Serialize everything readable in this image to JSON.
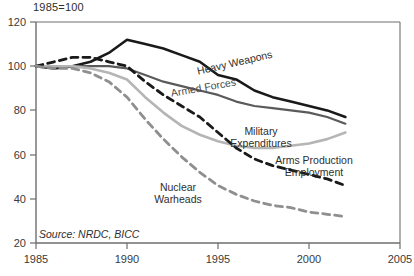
{
  "chart_data": {
    "type": "line",
    "title": "1985=100",
    "xlabel": "",
    "ylabel": "",
    "xlim": [
      1985,
      2005
    ],
    "ylim": [
      20,
      120
    ],
    "grid": false,
    "legend_position": "inline-annotations",
    "xticks": [
      "1985",
      "1990",
      "1995",
      "2000",
      "2005"
    ],
    "yticks": [
      "120",
      "100",
      "80",
      "60",
      "40",
      "20"
    ],
    "x": [
      1985,
      1986,
      1987,
      1988,
      1989,
      1990,
      1991,
      1992,
      1993,
      1994,
      1995,
      1996,
      1997,
      1998,
      1999,
      2000,
      2001,
      2002
    ],
    "series": [
      {
        "name": "Heavy Weapons",
        "style": "solid",
        "color": "#1a1a1a",
        "width": 2.6,
        "values": [
          100,
          99,
          100,
          102,
          106,
          112,
          110,
          108,
          105,
          102,
          96,
          94,
          89,
          86,
          84,
          82,
          80,
          77
        ]
      },
      {
        "name": "Armed Forces",
        "style": "solid",
        "color": "#5a5a5a",
        "width": 2.2,
        "values": [
          100,
          100,
          100,
          100,
          100,
          99,
          96,
          93,
          91,
          89,
          87,
          84,
          82,
          81,
          80,
          79,
          77,
          74
        ]
      },
      {
        "name": "Military Expenditures",
        "style": "solid",
        "color": "#b5b5b5",
        "width": 2.6,
        "values": [
          100,
          100,
          100,
          99,
          97,
          94,
          86,
          79,
          73,
          69,
          66,
          64,
          63,
          63,
          64,
          65,
          67,
          70
        ]
      },
      {
        "name": "Arms Production Employment",
        "style": "dashed",
        "color": "#1a1a1a",
        "width": 2.8,
        "values": [
          100,
          102,
          104,
          104,
          102,
          100,
          93,
          87,
          82,
          77,
          70,
          63,
          58,
          55,
          53,
          51,
          49,
          46
        ]
      },
      {
        "name": "Nuclear Warheads",
        "style": "dashed",
        "color": "#8f8f8f",
        "width": 2.8,
        "values": [
          100,
          99,
          99,
          97,
          93,
          86,
          76,
          67,
          59,
          52,
          46,
          42,
          39,
          37,
          36,
          34,
          33,
          32
        ]
      }
    ],
    "annotations": [
      {
        "name": "heavy-weapons-label",
        "text": "Heavy Weapons"
      },
      {
        "name": "armed-forces-label",
        "text": "Armed Forces"
      },
      {
        "name": "military-expenditures-label",
        "line1": "Military",
        "line2": "Expenditures"
      },
      {
        "name": "arms-production-label",
        "line1": "Arms Production",
        "line2": "Employment"
      },
      {
        "name": "nuclear-warheads-label",
        "line1": "Nuclear",
        "line2": "Warheads"
      }
    ],
    "source": "Source: NRDC, BICC"
  }
}
